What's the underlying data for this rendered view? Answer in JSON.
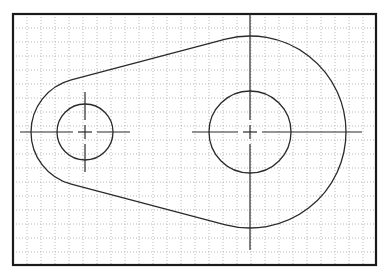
{
  "drawing": {
    "type": "cad-2d-sketch",
    "description": "Link/lever profile with two holes and centerlines on a dotted grid",
    "colors": {
      "background": "#ffffff",
      "border": "#1a1a1a",
      "geometry": "#2a2a2a",
      "grid": "#b8b8b8"
    },
    "frame": {
      "x": 13,
      "y": 14,
      "width": 363,
      "height": 251,
      "stroke_width": 2.2
    },
    "grid": {
      "spacing": 14,
      "origin_x": 13,
      "origin_y": 14
    },
    "small_hole": {
      "cx": 85,
      "cy": 132,
      "r": 28,
      "outer_r": 54
    },
    "large_hole": {
      "cx": 250,
      "cy": 132,
      "r": 41,
      "outer_r": 96
    },
    "centerlines": {
      "small_h": {
        "x1": 20,
        "x2": 130
      },
      "small_v": {
        "y1": 92,
        "y2": 172
      },
      "large_h": {
        "x1": 192,
        "x2": 362
      },
      "large_v": {
        "y1": 14,
        "y2": 250
      }
    }
  }
}
